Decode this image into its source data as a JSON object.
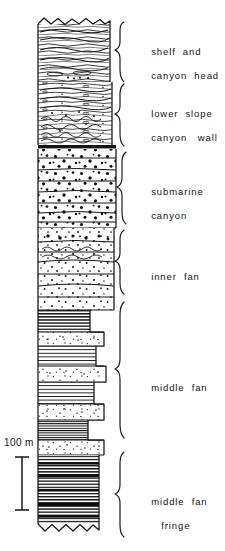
{
  "figure": {
    "kind": "stratigraphic-column",
    "ink_color": "#141414",
    "background_color": "#ffffff"
  },
  "scale_bar": {
    "label": "100 m",
    "value": 100,
    "units": "m",
    "bar_top_y": 457,
    "bar_bottom_y": 510
  },
  "column": {
    "left_x": 38,
    "top_y": 18,
    "bottom_y": 528,
    "top_boundary": "erosional-zigzag",
    "bottom_boundary": "erosional-zigzag"
  },
  "facies_units": [
    {
      "index": 0,
      "label": "shelf and\ncanyon head",
      "label_line_1": "shelf  and",
      "label_line_2": "canyon  head",
      "top_y": 18,
      "bottom_y": 82,
      "right_x": 110,
      "lithology": "wavy laminated mudstone / siltstone",
      "pattern": "wavy-laminae",
      "grain_size": "fine"
    },
    {
      "index": 1,
      "label": "lower slope\ncanyon wall",
      "label_line_1": "lower  slope",
      "label_line_2": "canyon   wall",
      "top_y": 82,
      "bottom_y": 145,
      "right_x": 112,
      "lithology": "interbedded siltstone with slumped / contorted beds",
      "pattern": "wavy-laminae-with-clasts",
      "grain_size": "fine-medium"
    },
    {
      "index": 2,
      "label": "submarine\ncanyon",
      "label_line_1": "submarine",
      "label_line_2": "canyon",
      "top_y": 148,
      "bottom_y": 228,
      "right_x": 116,
      "lithology": "pebble conglomerate, amalgamated beds",
      "pattern": "coarse-pebble-dots",
      "grain_size": "very coarse / conglomerate"
    },
    {
      "index": 3,
      "label": "inner fan",
      "label_line_1": "inner  fan",
      "label_line_2": "",
      "top_y": 228,
      "bottom_y": 310,
      "right_x": 114,
      "lithology": "pebbly sandstone with scoured bases",
      "pattern": "medium-dots",
      "grain_size": "coarse"
    },
    {
      "index": 4,
      "label": "middle fan",
      "label_line_1": "middle  fan",
      "label_line_2": "",
      "top_y": 310,
      "bottom_y": 455,
      "right_x": 102,
      "lithology": "thin-bedded turbidite sandstone and shale couplets",
      "pattern": "thin-horizontal-beds-with-sandy-interbeds",
      "grain_size": "medium-fine"
    },
    {
      "index": 5,
      "label": "middle fan\nfringe",
      "label_line_1": "middle  fan",
      "label_line_2": "fringe",
      "top_y": 455,
      "bottom_y": 528,
      "right_x": 98,
      "lithology": "shale-dominated thin turbidites",
      "pattern": "dark-thin-beds",
      "grain_size": "fine"
    }
  ],
  "braces": [
    {
      "unit_index": 0,
      "top_y": 22,
      "bottom_y": 82,
      "tip_y": 50,
      "label_y": 40
    },
    {
      "unit_index": 1,
      "top_y": 82,
      "bottom_y": 146,
      "tip_y": 114,
      "label_y": 99
    },
    {
      "unit_index": 2,
      "top_y": 150,
      "bottom_y": 228,
      "tip_y": 189,
      "label_y": 178
    },
    {
      "unit_index": 3,
      "top_y": 228,
      "bottom_y": 300,
      "tip_y": 264,
      "label_y": 262
    },
    {
      "unit_index": 4,
      "top_y": 300,
      "bottom_y": 452,
      "tip_y": 376,
      "label_y": 371
    },
    {
      "unit_index": 5,
      "top_y": 452,
      "bottom_y": 532,
      "tip_y": 492,
      "label_y": 489
    }
  ],
  "label_positions": [
    {
      "x": 137,
      "y": 33
    },
    {
      "x": 137,
      "y": 93
    },
    {
      "x": 137,
      "y": 172
    },
    {
      "x": 137,
      "y": 257
    },
    {
      "x": 137,
      "y": 365
    },
    {
      "x": 137,
      "y": 483
    }
  ]
}
